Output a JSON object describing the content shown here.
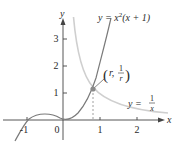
{
  "figure": {
    "axes": {
      "x_label": "x",
      "y_label": "y",
      "x_ticks": [
        "-1",
        "0",
        "1",
        "2"
      ],
      "y_ticks": [
        "1",
        "2",
        "3"
      ]
    },
    "curves": [
      {
        "name": "cubic",
        "label": "y = x²(x + 1)",
        "label_parts": {
          "lhs": "y = x",
          "exp": "2",
          "rhs": "(x + 1)"
        },
        "color": "#7a7a7a"
      },
      {
        "name": "reciprocal",
        "label": "y = 1/x",
        "label_parts": {
          "lhs": "y = ",
          "num": "1",
          "den": "x"
        },
        "color": "#c8c8c8"
      }
    ],
    "intersection": {
      "label": "(r, 1/r)",
      "parts": {
        "open": "(",
        "r": "r,",
        "num": "1",
        "den": "r",
        "close": ")"
      },
      "x": 0.8,
      "y": 1.25,
      "point_color": "#8a8a8a"
    }
  }
}
